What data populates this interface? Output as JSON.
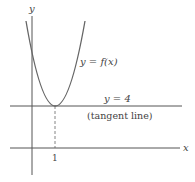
{
  "diagram": {
    "axis_labels": {
      "x": "x",
      "y": "y"
    },
    "curve_label": "y = f(x)",
    "tangent_label": "y = 4",
    "tangent_note": "(tangent line)",
    "tick_label": "1",
    "colors": {
      "curve": "#666666",
      "axes": "#555555",
      "text": "#444444"
    }
  }
}
